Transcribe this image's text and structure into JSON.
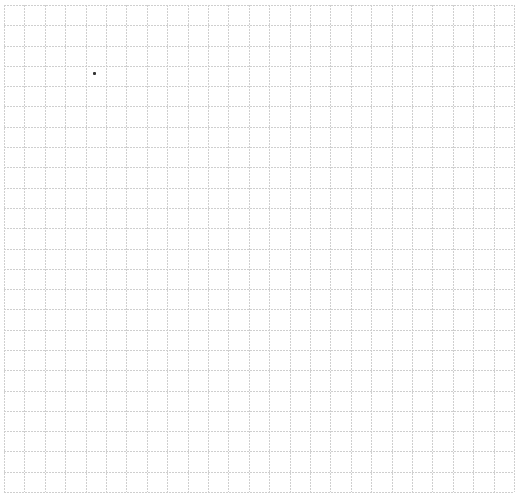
{
  "canvas": {
    "width": 521,
    "height": 497,
    "background": "#ffffff"
  },
  "grid": {
    "left": 4,
    "top": 5,
    "width": 510,
    "height": 487,
    "columns": 25,
    "rows": 24,
    "line_color": "#cfcfcf",
    "line_style": "dotted"
  },
  "markers": [
    {
      "x": 93,
      "y": 72,
      "size": 3,
      "color": "#333333"
    }
  ]
}
